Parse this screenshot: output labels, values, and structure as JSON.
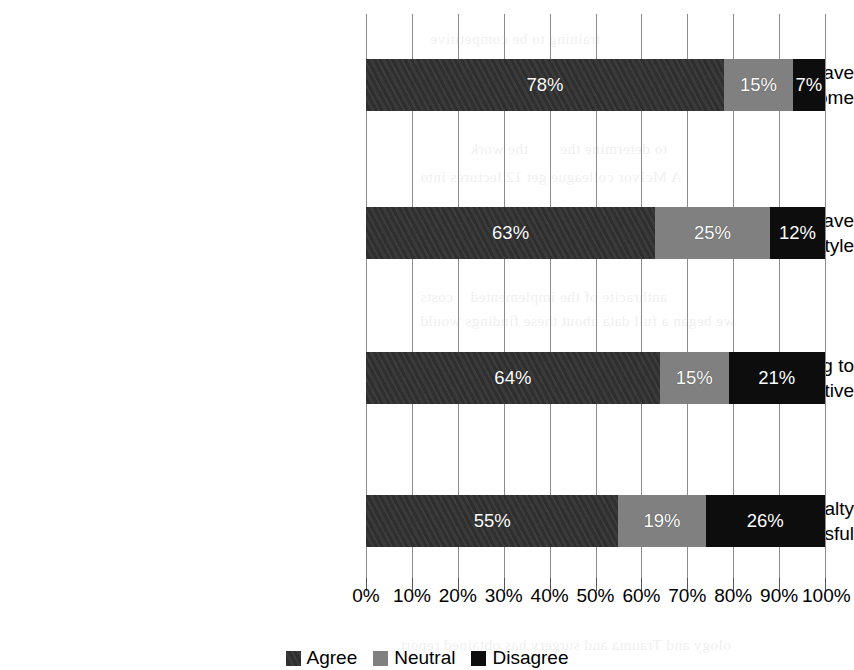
{
  "chart_data": {
    "type": "bar",
    "orientation": "horizontal",
    "stacked": true,
    "stack_mode": "percent",
    "title": "",
    "subtitle": "",
    "xlabel": "",
    "ylabel": "",
    "xlim": [
      0,
      100
    ],
    "grid": true,
    "grid_axis": "x",
    "legend_position": "bottom",
    "categories": [
      "If I complete specialty training I'll have a better income",
      "If I complete specialty training I'll have a better lifestyle",
      "I must complete specialty training to be competitive",
      "General surgeons must be specialty trained to be successful"
    ],
    "category_lines": [
      [
        "If I complete specialty training I'll have",
        "a better income"
      ],
      [
        "If I complete specialty training I'll have",
        "a better lifestyle"
      ],
      [
        "I must complete specialty training to",
        "be competitive"
      ],
      [
        "General surgeons must be specialty",
        "trained to be successful"
      ]
    ],
    "series": [
      {
        "name": "Agree",
        "color": "#333333",
        "values": [
          78,
          63,
          64,
          55
        ],
        "labels": [
          "78%",
          "63%",
          "64%",
          "55%"
        ]
      },
      {
        "name": "Neutral",
        "color": "#808080",
        "values": [
          15,
          25,
          15,
          19
        ],
        "labels": [
          "15%",
          "25%",
          "15%",
          "19%"
        ]
      },
      {
        "name": "Disagree",
        "color": "#0d0d0d",
        "values": [
          7,
          12,
          21,
          26
        ],
        "labels": [
          "7%",
          "12%",
          "21%",
          "26%"
        ]
      }
    ],
    "x_ticks": [
      0,
      10,
      20,
      30,
      40,
      50,
      60,
      70,
      80,
      90,
      100
    ],
    "x_ticklabels": [
      "0%",
      "10%",
      "20%",
      "30%",
      "40%",
      "50%",
      "60%",
      "70%",
      "80%",
      "90%",
      "100%"
    ]
  },
  "legend": {
    "items": [
      {
        "label": "Agree",
        "color": "#333333"
      },
      {
        "label": "Neutral",
        "color": "#808080"
      },
      {
        "label": "Disagree",
        "color": "#0d0d0d"
      }
    ]
  },
  "bleed_through": {
    "note": "faint reverse-side show-through from the scanned page; not legible content",
    "lines": [
      {
        "text": "training to be competitive",
        "x": 430,
        "y": 30
      },
      {
        "text": "the work",
        "x": 470,
        "y": 140
      },
      {
        "text": "to determine the",
        "x": 560,
        "y": 140
      },
      {
        "text": "A McIvor colleague get 12 lectures into",
        "x": 420,
        "y": 168
      },
      {
        "text": "costs",
        "x": 420,
        "y": 288
      },
      {
        "text": "anthracite of the implemented",
        "x": 470,
        "y": 288
      },
      {
        "text": "we began a full data about these findings would",
        "x": 420,
        "y": 312
      },
      {
        "text": "ology and Trauma and surgery has obtained report",
        "x": 400,
        "y": 636
      }
    ]
  }
}
